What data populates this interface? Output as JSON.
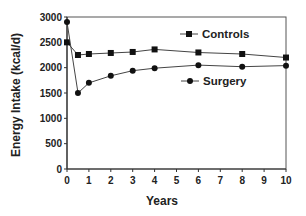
{
  "chart_data": {
    "type": "line",
    "title": "",
    "xlabel": "Years",
    "ylabel": "Energy Intake (kcal/d)",
    "xlim": [
      0,
      10
    ],
    "ylim": [
      0,
      3000
    ],
    "x_ticks": [
      "0",
      "1",
      "2",
      "3",
      "4",
      "5",
      "6",
      "7",
      "8",
      "9",
      "10"
    ],
    "y_ticks": [
      "0",
      "500",
      "1000",
      "1500",
      "2000",
      "2500",
      "3000"
    ],
    "grid": false,
    "legend_position": "inside-right",
    "series": [
      {
        "name": "Controls",
        "marker": "square",
        "x": [
          0,
          0.5,
          1,
          2,
          3,
          4,
          6,
          8,
          10
        ],
        "values": [
          2500,
          2250,
          2270,
          2290,
          2310,
          2360,
          2300,
          2270,
          2200
        ]
      },
      {
        "name": "Surgery",
        "marker": "circle",
        "x": [
          0,
          0.5,
          1,
          2,
          3,
          4,
          6,
          8,
          10
        ],
        "values": [
          2900,
          1500,
          1700,
          1840,
          1940,
          1990,
          2050,
          2020,
          2040
        ]
      }
    ]
  }
}
